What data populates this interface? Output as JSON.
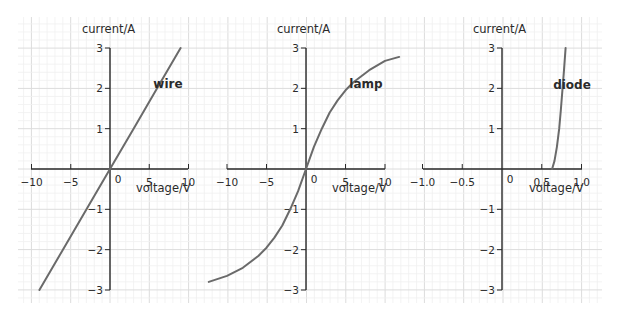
{
  "figure": {
    "background": "#ffffff",
    "grid_major_color": "#dcdcdc",
    "grid_minor_color": "#f0f0f0",
    "axis_color": "#2a2a2a",
    "curve_color": "#6a6a6a"
  },
  "chart_data": [
    {
      "type": "line",
      "title": "",
      "curve_label": "wire",
      "xlabel": "voltage/V",
      "ylabel": "current/A",
      "xlim": [
        -10,
        10
      ],
      "ylim": [
        -3,
        3
      ],
      "x_ticks": [
        -10,
        -5,
        0,
        5,
        10
      ],
      "x_tick_labels": [
        "−10",
        "−5",
        "0",
        "5",
        "10"
      ],
      "y_ticks": [
        -3,
        -2,
        -1,
        1,
        2,
        3
      ],
      "y_tick_labels": [
        "−3",
        "−2",
        "−1",
        "1",
        "2",
        "3"
      ],
      "grid": true,
      "series": [
        {
          "name": "wire",
          "x": [
            -9,
            -6,
            -3,
            0,
            3,
            6,
            9
          ],
          "y": [
            -3,
            -2,
            -1,
            0,
            1,
            2,
            3
          ]
        }
      ]
    },
    {
      "type": "line",
      "title": "",
      "curve_label": "lamp",
      "xlabel": "voltage/V",
      "ylabel": "current/A",
      "xlim": [
        -10,
        10
      ],
      "ylim": [
        -3,
        3
      ],
      "x_ticks": [
        -10,
        -5,
        0,
        5,
        10
      ],
      "x_tick_labels": [
        "−10",
        "−5",
        "0",
        "5",
        "10"
      ],
      "y_ticks": [
        -3,
        -2,
        -1,
        1,
        2,
        3
      ],
      "y_tick_labels": [
        "−3",
        "−2",
        "−1",
        "1",
        "2",
        "3"
      ],
      "grid": true,
      "series": [
        {
          "name": "lamp",
          "x": [
            -12.3,
            -10,
            -8,
            -6,
            -5,
            -4,
            -3,
            -2,
            -1,
            0,
            1,
            2,
            3,
            4,
            5,
            6,
            8,
            10,
            11.8
          ],
          "y": [
            -2.8,
            -2.65,
            -2.45,
            -2.15,
            -1.95,
            -1.7,
            -1.4,
            -1.0,
            -0.55,
            0,
            0.55,
            1.0,
            1.4,
            1.7,
            1.95,
            2.15,
            2.45,
            2.68,
            2.78
          ]
        }
      ]
    },
    {
      "type": "line",
      "title": "",
      "curve_label": "diode",
      "xlabel": "voltage/V",
      "ylabel": "current/A",
      "xlim": [
        -1.0,
        1.0
      ],
      "ylim": [
        -3,
        3
      ],
      "x_ticks": [
        -1.0,
        -0.5,
        0,
        0.5,
        1.0
      ],
      "x_tick_labels": [
        "−1.0",
        "−0.5",
        "0",
        "0.5",
        "1.0"
      ],
      "y_ticks": [
        -3,
        -2,
        -1,
        1,
        2,
        3
      ],
      "y_tick_labels": [
        "−3",
        "−2",
        "−1",
        "1",
        "2",
        "3"
      ],
      "grid": true,
      "series": [
        {
          "name": "diode",
          "x": [
            0.63,
            0.66,
            0.69,
            0.72,
            0.74,
            0.76,
            0.78,
            0.8
          ],
          "y": [
            0,
            0.2,
            0.55,
            1.0,
            1.45,
            1.95,
            2.45,
            3.0
          ]
        }
      ]
    }
  ]
}
